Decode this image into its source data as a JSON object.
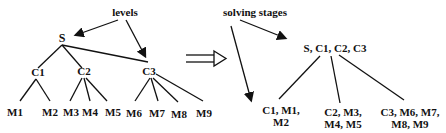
{
  "left_tree": {
    "annotation": "levels",
    "root": "S",
    "level1": [
      "C1",
      "C2",
      "C3"
    ],
    "leaves": [
      "M1",
      "M2",
      "M3",
      "M4",
      "M5",
      "M6",
      "M7",
      "M8",
      "M9"
    ],
    "edges": [
      [
        "S",
        "C1"
      ],
      [
        "S",
        "C2"
      ],
      [
        "S",
        "C3"
      ],
      [
        "C1",
        "M1"
      ],
      [
        "C1",
        "M2"
      ],
      [
        "C2",
        "M3"
      ],
      [
        "C2",
        "M4"
      ],
      [
        "C2",
        "M5"
      ],
      [
        "C3",
        "M6"
      ],
      [
        "C3",
        "M7"
      ],
      [
        "C3",
        "M8"
      ],
      [
        "C3",
        "M9"
      ]
    ]
  },
  "transform_arrow": "double-arrow-right",
  "right_tree": {
    "annotation": "solving stages",
    "root": "S, C1, C2, C3",
    "children": [
      {
        "line1": "C1, M1,",
        "line2": "M2"
      },
      {
        "line1": "C2, M3,",
        "line2": "M4, M5"
      },
      {
        "line1": "C3, M6, M7,",
        "line2": "M8, M9"
      }
    ]
  }
}
